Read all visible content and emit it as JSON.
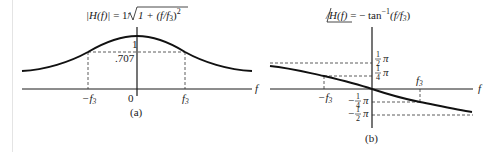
{
  "figure": {
    "panel_a": {
      "caption": "(a)",
      "title": {
        "lhs": "|H(f)|",
        "equals": " = 1/",
        "radicand": "1 + (f/f",
        "radicand_sub": "3",
        "radicand_close": ")",
        "exponent": "2"
      },
      "y_ticks": {
        "peak": "1",
        "half_power": ".707"
      },
      "x_ticks": {
        "neg_f3": "−f",
        "neg_f3_sub": "3",
        "zero": "0",
        "pos_f3": "f",
        "pos_f3_sub": "3"
      },
      "x_axis_label": "f"
    },
    "panel_b": {
      "caption": "(b)",
      "title": {
        "lhs": "/H(f)",
        "rhs": " = − tan",
        "exponent": "−1",
        "arg": "(f/f",
        "arg_sub": "3",
        "arg_close": ")"
      },
      "y_ticks": {
        "half_pi_num": "1",
        "half_pi_den": "2",
        "pi": "π",
        "quarter_pi_num": "1",
        "quarter_pi_den": "4",
        "neg_sign": "−"
      },
      "x_ticks": {
        "neg_f3": "−f",
        "neg_f3_sub": "3",
        "pos_f3": "f",
        "pos_f3_sub": "3"
      },
      "x_axis_label_left": "f",
      "x_axis_label_right": "f"
    }
  },
  "colors": {
    "ink": "#1a1a1a",
    "dash": "#333333",
    "rule": "#e4e4e4"
  }
}
